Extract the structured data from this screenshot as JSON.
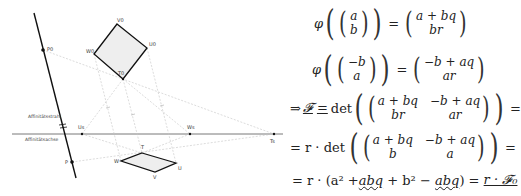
{
  "diagram": {
    "labels": {
      "P0": "P0",
      "P": "P",
      "V0": "V0",
      "U0": "U0",
      "W0": "W0",
      "T0": "T0",
      "T": "T",
      "W": "W",
      "U": "U",
      "V": "V",
      "Us": "Us",
      "Ws": "Ws",
      "Ts": "Ts",
      "axis_above": "Affinitätsstrahl",
      "axis_below": "Affinitätsachse"
    },
    "colors": {
      "line": "#111111",
      "dashed": "#bbbbbb",
      "fill": "#eeeeee"
    }
  },
  "math": {
    "line1": {
      "phi": "φ",
      "vec": [
        "a",
        "b"
      ],
      "eq": "=",
      "result": [
        "a + bq",
        "br"
      ]
    },
    "line2": {
      "phi": "φ",
      "vec": [
        "−b",
        "a"
      ],
      "eq": "=",
      "result": [
        "−b + aq",
        "ar"
      ]
    },
    "line3": {
      "implies": "⇒",
      "F": "𝓕",
      "eq": "=",
      "det": "det",
      "m": [
        "a + bq",
        "−b + aq",
        "br",
        "ar"
      ],
      "tail": "="
    },
    "line4": {
      "lead": "= r · det",
      "m": [
        "a + bq",
        "−b + aq",
        "b",
        "a"
      ],
      "tail": "="
    },
    "line5": {
      "lead": "= r · (a² + ",
      "abq1": "abq",
      "mid": " + b² − ",
      "abq2": "abq",
      "close": ") = ",
      "result": "r · 𝓕₀"
    }
  }
}
